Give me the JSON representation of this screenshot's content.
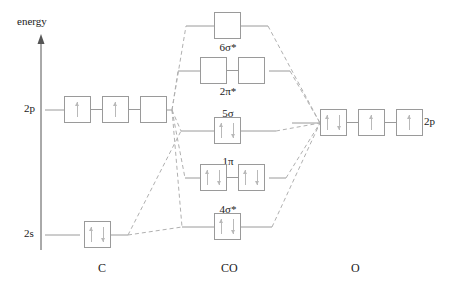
{
  "diagram": {
    "axis": {
      "label": "energy",
      "icon": "up-arrow-icon"
    },
    "columns": [
      {
        "id": "c",
        "label": "C",
        "x": 102
      },
      {
        "id": "co",
        "label": "CO",
        "x": 228
      },
      {
        "id": "o",
        "label": "O",
        "x": 354
      }
    ],
    "atomic_levels": [
      {
        "id": "c-2p",
        "label": "2p",
        "side": "left",
        "atom": "C",
        "boxes": [
          {
            "electrons": [
              "up"
            ]
          },
          {
            "electrons": [
              "up"
            ]
          },
          {
            "electrons": []
          }
        ]
      },
      {
        "id": "c-2s",
        "label": "2s",
        "side": "left",
        "atom": "C",
        "boxes": [
          {
            "electrons": [
              "up",
              "down"
            ]
          }
        ]
      },
      {
        "id": "o-2p",
        "label": "2p",
        "side": "right",
        "atom": "O",
        "boxes": [
          {
            "electrons": [
              "up",
              "down"
            ]
          },
          {
            "electrons": [
              "up"
            ]
          },
          {
            "electrons": [
              "up"
            ]
          }
        ]
      }
    ],
    "molecular_orbitals": [
      {
        "id": "mo-6sigma-star",
        "label": "6σ*",
        "label_pos": "below",
        "boxes": [
          {
            "electrons": []
          }
        ]
      },
      {
        "id": "mo-2pi-star",
        "label": "2π*",
        "label_pos": "below",
        "boxes": [
          {
            "electrons": []
          },
          {
            "electrons": []
          }
        ]
      },
      {
        "id": "mo-5sigma",
        "label": "5σ",
        "label_pos": "above",
        "boxes": [
          {
            "electrons": [
              "up",
              "down"
            ]
          }
        ]
      },
      {
        "id": "mo-1pi",
        "label": "1π",
        "label_pos": "above",
        "boxes": [
          {
            "electrons": [
              "up",
              "down"
            ]
          },
          {
            "electrons": [
              "up",
              "down"
            ]
          }
        ]
      },
      {
        "id": "mo-4sigma-star",
        "label": "4σ*",
        "label_pos": "above",
        "boxes": [
          {
            "electrons": [
              "up",
              "down"
            ]
          }
        ]
      }
    ],
    "colors": {
      "box_stroke": "#9a9a9a",
      "level_line": "#9a9a9a",
      "correlation_line": "#b0b0b0",
      "axis": "#555555",
      "text": "#1a1a1a",
      "electron": "#b9b9b9"
    }
  }
}
